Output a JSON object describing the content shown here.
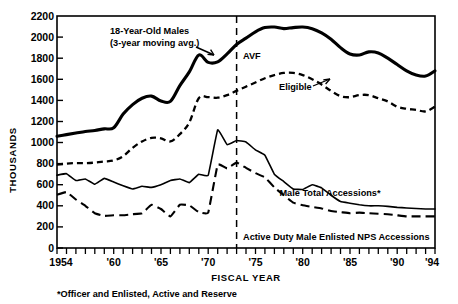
{
  "chart_data": {
    "type": "line",
    "title": "",
    "xlabel": "FISCAL YEAR",
    "ylabel": "THOUSANDS",
    "xlim": [
      1954,
      1994
    ],
    "ylim": [
      0,
      2200
    ],
    "ytick_step": 200,
    "grid": false,
    "legend_position": "inline-annotations",
    "yticks": [
      "0",
      "200",
      "400",
      "600",
      "800",
      "1000",
      "1200",
      "1400",
      "1600",
      "1800",
      "2000",
      "2200"
    ],
    "xticks_labeled": [
      "1954",
      "'60",
      "'65",
      "'70",
      "'75",
      "'80",
      "'85",
      "'90",
      "'94"
    ],
    "xtick_values_labeled": [
      1954,
      1960,
      1965,
      1970,
      1975,
      1980,
      1985,
      1990,
      1994
    ],
    "x": [
      1954,
      1955,
      1956,
      1957,
      1958,
      1959,
      1960,
      1961,
      1962,
      1963,
      1964,
      1965,
      1966,
      1967,
      1968,
      1969,
      1970,
      1971,
      1972,
      1973,
      1974,
      1975,
      1976,
      1977,
      1978,
      1979,
      1980,
      1981,
      1982,
      1983,
      1984,
      1985,
      1986,
      1987,
      1988,
      1989,
      1990,
      1991,
      1992,
      1993,
      1994
    ],
    "series": [
      {
        "name": "18-Year-Old Males (3-year moving avg.)",
        "style": "solid-thick",
        "values": [
          1060,
          1075,
          1090,
          1105,
          1115,
          1130,
          1140,
          1270,
          1360,
          1420,
          1440,
          1395,
          1390,
          1540,
          1670,
          1830,
          1760,
          1765,
          1840,
          1930,
          1990,
          2050,
          2090,
          2095,
          2080,
          2090,
          2095,
          2080,
          2040,
          1980,
          1900,
          1840,
          1830,
          1860,
          1850,
          1800,
          1740,
          1680,
          1640,
          1630,
          1680
        ]
      },
      {
        "name": "Eligible",
        "style": "dashed-medium",
        "values": [
          790,
          800,
          805,
          805,
          810,
          820,
          830,
          870,
          950,
          1010,
          1045,
          1040,
          1010,
          1080,
          1190,
          1420,
          1430,
          1425,
          1450,
          1490,
          1530,
          1570,
          1610,
          1640,
          1660,
          1660,
          1640,
          1600,
          1550,
          1490,
          1440,
          1430,
          1450,
          1450,
          1420,
          1390,
          1340,
          1320,
          1310,
          1295,
          1340
        ]
      },
      {
        "name": "Male Total Accessions*",
        "style": "solid-thin",
        "values": [
          690,
          705,
          640,
          655,
          605,
          660,
          625,
          590,
          560,
          585,
          575,
          600,
          640,
          655,
          620,
          700,
          690,
          1120,
          980,
          1020,
          1005,
          930,
          880,
          700,
          630,
          560,
          555,
          600,
          570,
          500,
          440,
          425,
          410,
          400,
          400,
          395,
          385,
          380,
          375,
          370,
          370
        ]
      },
      {
        "name": "Active Duty Male Enlisted NPS Accessions",
        "style": "dashed-long",
        "values": [
          505,
          530,
          460,
          400,
          330,
          305,
          310,
          310,
          320,
          330,
          410,
          370,
          300,
          410,
          405,
          340,
          335,
          790,
          755,
          810,
          760,
          710,
          670,
          575,
          500,
          430,
          405,
          390,
          375,
          350,
          340,
          330,
          335,
          330,
          325,
          320,
          310,
          300,
          300,
          300,
          300
        ]
      }
    ],
    "annotations": [
      {
        "name": "top-curve-label",
        "text": "18-Year-Old Males",
        "text2": "(3-year moving avg.)"
      },
      {
        "name": "avf-label",
        "text": "AVF"
      },
      {
        "name": "eligible-label",
        "text": "Eligible"
      },
      {
        "name": "male-total-accessions-label",
        "text": "Male Total Accessions*"
      },
      {
        "name": "nps-accessions-label",
        "text": "Active Duty Male Enlisted NPS Accessions"
      }
    ],
    "vertical_marker": {
      "name": "avf-divider",
      "value": 1973,
      "style": "dashed",
      "label": "AVF"
    },
    "footnote": "*Officer and Enlisted, Active and Reserve",
    "colors": {
      "ink": "#000000",
      "background": "#ffffff"
    }
  },
  "axes": {
    "y_title": "THOUSANDS",
    "x_title": "FISCAL YEAR"
  },
  "footnote": {
    "text": "*Officer and Enlisted, Active and Reserve"
  }
}
